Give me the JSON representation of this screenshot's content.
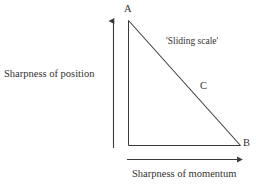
{
  "figure": {
    "background_color": "#ffffff",
    "stroke_color": "#3a3a3a",
    "text_color": "#33312f"
  },
  "diagram": {
    "type": "right-triangle-schematic",
    "vertices": [
      {
        "id": "A",
        "label": "A",
        "role": "apex-top-left"
      },
      {
        "id": "B",
        "label": "B",
        "role": "bottom-right"
      },
      {
        "id": "C",
        "label": "C",
        "role": "hypotenuse-midpoint-label"
      }
    ],
    "annotation": {
      "label": "'Sliding scale'"
    },
    "axes": {
      "y": {
        "label": "Sharpness of position",
        "direction": "up"
      },
      "x": {
        "label": "Sharpness of momentum",
        "direction": "right"
      }
    }
  }
}
